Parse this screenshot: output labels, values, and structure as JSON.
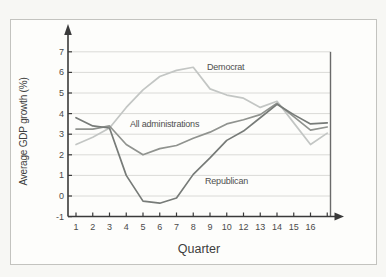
{
  "chart_data": {
    "type": "line",
    "title": "",
    "xlabel": "Quarter",
    "ylabel": "Average GDP growth (%)",
    "x_tick_labels": [
      "1",
      "2",
      "3",
      "4",
      "5",
      "6",
      "7",
      "8",
      "9",
      "10",
      "12",
      "13",
      "14",
      "15",
      "16"
    ],
    "x_point_count": 16,
    "y_ticks": [
      7,
      6,
      5,
      4,
      3,
      2,
      1,
      0,
      -1
    ],
    "y_tick_labels": [
      "7",
      "6",
      "5",
      "4",
      "3",
      "2",
      "1",
      "0",
      "-1"
    ],
    "ylim": [
      -1,
      7.5
    ],
    "grid": "horizontal",
    "legend_position": "inline-labels",
    "series": [
      {
        "name": "Democrat",
        "color": "#c3c6c4",
        "values": [
          2.5,
          2.85,
          3.3,
          4.3,
          5.15,
          5.8,
          6.1,
          6.25,
          5.2,
          4.9,
          4.75,
          4.3,
          4.6,
          3.55,
          2.5,
          3.05
        ]
      },
      {
        "name": "All administrations",
        "color": "#90938f",
        "values": [
          3.25,
          3.25,
          3.4,
          2.5,
          2.0,
          2.3,
          2.45,
          2.8,
          3.1,
          3.5,
          3.7,
          3.95,
          4.5,
          3.85,
          3.2,
          3.35
        ]
      },
      {
        "name": "Republican",
        "color": "#777b78",
        "values": [
          3.8,
          3.4,
          3.3,
          1.0,
          -0.25,
          -0.35,
          -0.1,
          1.05,
          1.85,
          2.7,
          3.15,
          3.8,
          4.45,
          3.95,
          3.5,
          3.55
        ]
      }
    ],
    "annotations": [
      {
        "text": "Democrat",
        "x": 207,
        "y": 62
      },
      {
        "text": "All administrations",
        "x": 130,
        "y": 119
      },
      {
        "text": "Republican",
        "x": 205,
        "y": 176
      }
    ]
  },
  "colors": {
    "axis": "#3a3a3a",
    "grid": "#dadad7",
    "right_border": "#6a6a6a",
    "tick_text": "#4a4a4a"
  }
}
